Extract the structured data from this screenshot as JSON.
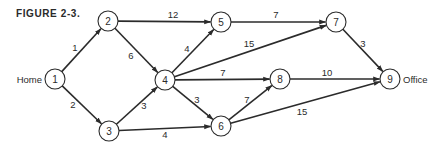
{
  "figure": {
    "title": "FIGURE 2-3.",
    "start_label": "Home",
    "end_label": "Office"
  },
  "colors": {
    "ink": "#2b2b2b",
    "background": "#ffffff"
  },
  "nodes": [
    {
      "id": "1",
      "x": 55,
      "y": 79
    },
    {
      "id": "2",
      "x": 108,
      "y": 21
    },
    {
      "id": "3",
      "x": 109,
      "y": 131
    },
    {
      "id": "4",
      "x": 165,
      "y": 80
    },
    {
      "id": "5",
      "x": 221,
      "y": 22
    },
    {
      "id": "6",
      "x": 221,
      "y": 126
    },
    {
      "id": "7",
      "x": 336,
      "y": 22
    },
    {
      "id": "8",
      "x": 280,
      "y": 79
    },
    {
      "id": "9",
      "x": 390,
      "y": 79
    }
  ],
  "edges": [
    {
      "from": "1",
      "to": "2",
      "weight": "1",
      "lx": 75,
      "ly": 47
    },
    {
      "from": "1",
      "to": "3",
      "weight": "2",
      "lx": 73,
      "ly": 104
    },
    {
      "from": "2",
      "to": "5",
      "weight": "12",
      "lx": 173,
      "ly": 14
    },
    {
      "from": "2",
      "to": "4",
      "weight": "6",
      "lx": 131,
      "ly": 55
    },
    {
      "from": "3",
      "to": "4",
      "weight": "3",
      "lx": 144,
      "ly": 105
    },
    {
      "from": "3",
      "to": "6",
      "weight": "4",
      "lx": 165,
      "ly": 134
    },
    {
      "from": "4",
      "to": "5",
      "weight": "4",
      "lx": 187,
      "ly": 48
    },
    {
      "from": "4",
      "to": "7",
      "weight": "15",
      "lx": 249,
      "ly": 43
    },
    {
      "from": "4",
      "to": "8",
      "weight": "7",
      "lx": 223,
      "ly": 72
    },
    {
      "from": "4",
      "to": "6",
      "weight": "3",
      "lx": 197,
      "ly": 99
    },
    {
      "from": "5",
      "to": "7",
      "weight": "7",
      "lx": 276,
      "ly": 14
    },
    {
      "from": "6",
      "to": "8",
      "weight": "7",
      "lx": 247,
      "ly": 99
    },
    {
      "from": "6",
      "to": "9",
      "weight": "15",
      "lx": 302,
      "ly": 111
    },
    {
      "from": "7",
      "to": "9",
      "weight": "3",
      "lx": 363,
      "ly": 43
    },
    {
      "from": "8",
      "to": "9",
      "weight": "10",
      "lx": 327,
      "ly": 72
    }
  ]
}
